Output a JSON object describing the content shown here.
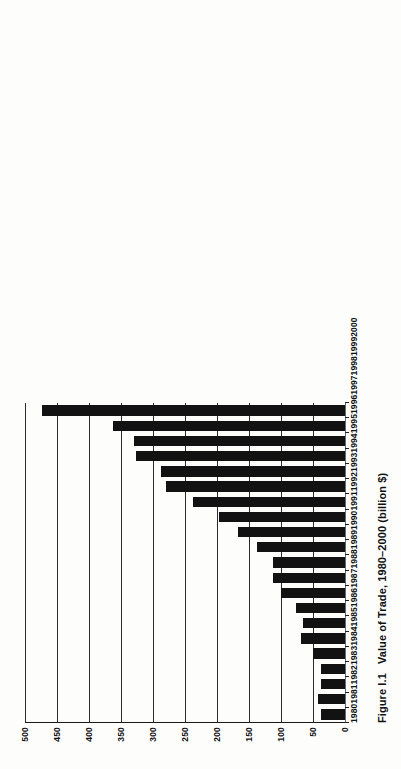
{
  "figure": {
    "caption_number": "Figure I.1",
    "caption_text": "Value of Trade, 1980–2000 (billion $)"
  },
  "chart_data": {
    "type": "bar",
    "title": "Value of Trade, 1980–2000 (billion $)",
    "xlabel": "",
    "ylabel": "",
    "ylim": [
      0,
      500
    ],
    "ytick_step": 50,
    "grid": true,
    "legend": "none",
    "orientation": "vertical-bars-on-rotated-page",
    "bar_color": "#121212",
    "categories": [
      "1980",
      "1981",
      "1982",
      "1983",
      "1984",
      "1985",
      "1986",
      "1987",
      "1988",
      "1989",
      "1990",
      "1991",
      "1992",
      "1993",
      "1994",
      "1995",
      "1996",
      "1997",
      "1998",
      "1999",
      "2000"
    ],
    "values": [
      37,
      42,
      38,
      38,
      50,
      68,
      65,
      77,
      100,
      112,
      112,
      138,
      167,
      197,
      237,
      280,
      287,
      327,
      330,
      362,
      473
    ],
    "ytick_labels": [
      "0",
      "50",
      "100",
      "150",
      "200",
      "250",
      "300",
      "350",
      "400",
      "450",
      "500"
    ],
    "ytick_values": [
      0,
      50,
      100,
      150,
      200,
      250,
      300,
      350,
      400,
      450,
      500
    ],
    "units": "billion $"
  }
}
